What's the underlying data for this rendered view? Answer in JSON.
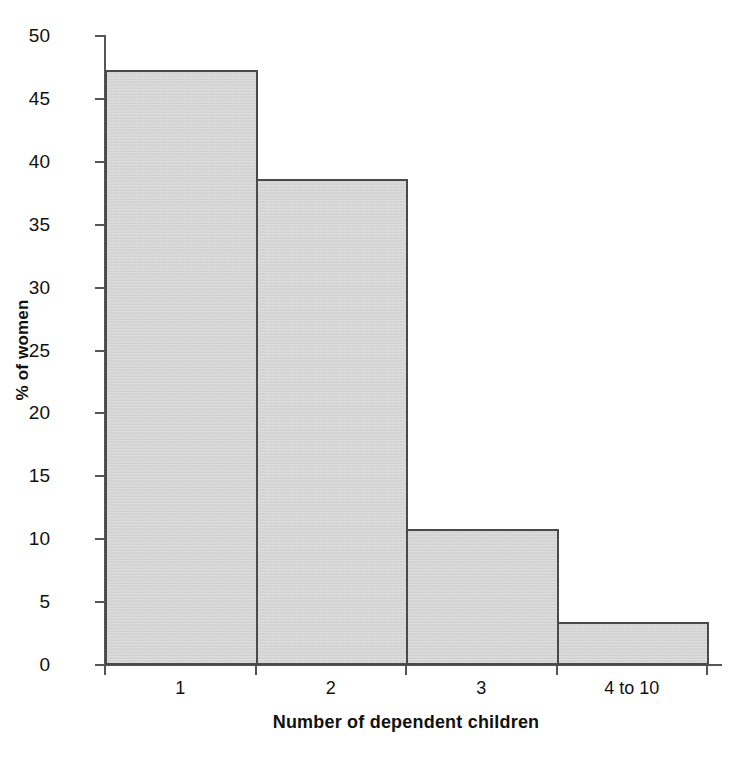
{
  "chart_data": {
    "type": "bar",
    "title": "",
    "subtitle": "",
    "xlabel": "Number of dependent children",
    "ylabel": "% of women",
    "categories": [
      "1",
      "2",
      "3",
      "4 to 10"
    ],
    "values": [
      47.3,
      38.6,
      10.8,
      3.4
    ],
    "ylim": [
      0,
      50
    ],
    "ytick_step": 5,
    "yticks": [
      0,
      5,
      10,
      15,
      20,
      25,
      30,
      35,
      40,
      45,
      50
    ],
    "ytick_labels": [
      "0",
      "5",
      "10",
      "15",
      "20",
      "25",
      "30",
      "35",
      "40",
      "45",
      "50"
    ],
    "grid": false,
    "legend": false,
    "legend_position": "none",
    "bar_gap": 0,
    "colors": {
      "bar_fill": "#d5d5d5",
      "bar_outline": "#4a4a4a",
      "axis": "#555555",
      "text": "#111111",
      "background": "#ffffff"
    }
  }
}
